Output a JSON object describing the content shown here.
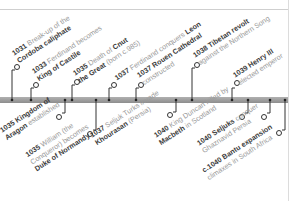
{
  "timeline": {
    "events_above": [
      {
        "year": "1031",
        "text1": "Break-up of the",
        "bold1": "",
        "text2": "",
        "bold2": "Cordoba caliphate"
      },
      {
        "year": "1033",
        "text1": "Ferdinand becomes",
        "bold1": "",
        "text2": "",
        "bold2": "King of Castile"
      },
      {
        "year": "1035",
        "text1": "Death of ",
        "bold1": "Cnut",
        "text2": " (born c.985)",
        "bold2": "the Great"
      },
      {
        "year": "1037",
        "text1": "Ferdinand conquers ",
        "bold1": "Leon",
        "text2": "",
        "bold2": ""
      },
      {
        "year": "1037",
        "text1": "",
        "bold1": "Rouen Cathedral",
        "text2": "constructed",
        "bold2": ""
      },
      {
        "year": "1038",
        "text1": "",
        "bold1": "Tibetan revolt",
        "text2": "against the Northern Song",
        "bold2": ""
      },
      {
        "year": "1039",
        "text1": "",
        "bold1": "Henry III",
        "text2": "elected emperor",
        "bold2": ""
      }
    ],
    "events_below": [
      {
        "year": "1035",
        "text1": "",
        "bold1": "Kingdom of",
        "text2": "",
        "bold2": "Aragon",
        "text3": " established"
      },
      {
        "year": "1035",
        "text1": "William (the",
        "bold1": "",
        "text2": "Conqueror) becomes",
        "bold2": "Duke of Normandy",
        "text3": ""
      },
      {
        "year": "1037",
        "text1": "Seljuk Turks invade",
        "bold1": "",
        "text2": "",
        "bold2": "Khourasan",
        "text3": " (Persia)"
      },
      {
        "year": "1040",
        "text1": "King Duncan killed by",
        "bold1": "",
        "text2": " in Scotland",
        "bold2": "Macbeth",
        "text3": ""
      },
      {
        "year": "1040",
        "text1": "",
        "bold1": "Seljuks",
        "text2": "Ghaznavid Persia",
        "bold2": "",
        "text3": " conquer"
      },
      {
        "year": "c.1040",
        "text1": "",
        "bold1": "Bantu expansion",
        "text2": "climaxes in South Africa",
        "bold2": "",
        "text3": ""
      }
    ]
  },
  "colors": {
    "bar": "#9a9a9a",
    "bold_text": "#3a3a3a",
    "light_text": "#9a9a9a",
    "connector": "#333333"
  }
}
